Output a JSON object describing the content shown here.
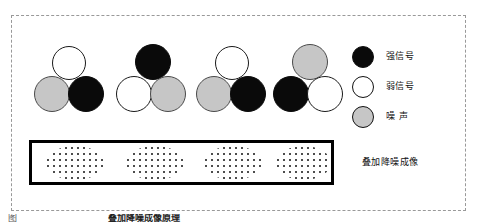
{
  "figure": {
    "clusters": [
      {
        "name": "cluster-1",
        "top": "weak",
        "bottom_left": "noise",
        "bottom_right": "strong"
      },
      {
        "name": "cluster-2",
        "top": "strong",
        "bottom_left": "weak",
        "bottom_right": "noise"
      },
      {
        "name": "cluster-3",
        "top": "weak",
        "bottom_left": "noise",
        "bottom_right": "strong"
      },
      {
        "name": "cluster-4",
        "top": "noise",
        "bottom_left": "strong",
        "bottom_right": "weak"
      }
    ],
    "overlay_box": {
      "blob_count": 4,
      "blob_texture": "stippled-dots"
    }
  },
  "legend": {
    "items": [
      {
        "swatch": "filled-black-circle",
        "label": "强信号"
      },
      {
        "swatch": "outlined-white-circle",
        "label": "弱信号"
      },
      {
        "swatch": "filled-gray-circle",
        "label": "噪  声"
      }
    ],
    "overlay_label": "叠加降噪成像"
  },
  "caption": {
    "clipped_left": "图  ",
    "clipped_right": "叠加降噪成像原理"
  },
  "colors": {
    "strong_signal": "#0a0a0a",
    "weak_signal": "#ffffff",
    "noise": "#c6c6c6",
    "outline": "#111111",
    "frame_dash": "#999999",
    "box_border": "#000000",
    "background": "#ffffff"
  }
}
